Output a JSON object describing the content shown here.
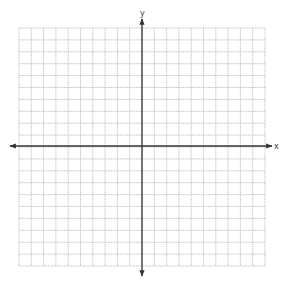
{
  "diagram": {
    "type": "coordinate-plane",
    "grid": {
      "left": 19,
      "top": 28,
      "right": 265,
      "bottom": 266,
      "columns": 20,
      "rows": 20,
      "line_color": "#b9b9b9"
    },
    "axes": {
      "color": "#333333",
      "x_axis": {
        "label": "x",
        "y": 146,
        "start": 10,
        "end": 272
      },
      "y_axis": {
        "label": "y",
        "x": 142,
        "start": 19,
        "end": 276
      }
    }
  }
}
